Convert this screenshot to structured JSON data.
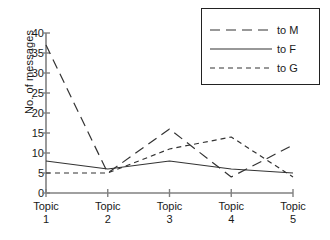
{
  "chart_data": {
    "type": "line",
    "title": "",
    "xlabel": "",
    "ylabel": "No. of messages",
    "categories": [
      "Topic 1",
      "Topic 2",
      "Topic 3",
      "Topic 4",
      "Topic 5"
    ],
    "category_lines": [
      {
        "name": "Topic",
        "num": "1"
      },
      {
        "name": "Topic",
        "num": "2"
      },
      {
        "name": "Topic",
        "num": "3"
      },
      {
        "name": "Topic",
        "num": "4"
      },
      {
        "name": "Topic",
        "num": "5"
      }
    ],
    "ylim": [
      0,
      40
    ],
    "yticks": [
      0,
      5,
      10,
      15,
      20,
      25,
      30,
      35,
      40
    ],
    "ytick_labels": [
      "0",
      "5",
      "10",
      "15",
      "20",
      "25",
      "30",
      "35",
      "40"
    ],
    "grid": false,
    "legend_position": "top-right",
    "series": [
      {
        "name": "to M",
        "style": "long-dash",
        "color": "#333333",
        "values": [
          37,
          5,
          16,
          4,
          12
        ]
      },
      {
        "name": "to F",
        "style": "solid",
        "color": "#333333",
        "values": [
          8,
          6,
          8,
          6,
          5
        ]
      },
      {
        "name": "to G",
        "style": "short-dash",
        "color": "#333333",
        "values": [
          5,
          5,
          11,
          14,
          4
        ]
      }
    ]
  },
  "axis": {
    "line_color": "#808080"
  },
  "legend": {
    "entries": [
      {
        "label": "to M"
      },
      {
        "label": "to F"
      },
      {
        "label": "to G"
      }
    ]
  }
}
